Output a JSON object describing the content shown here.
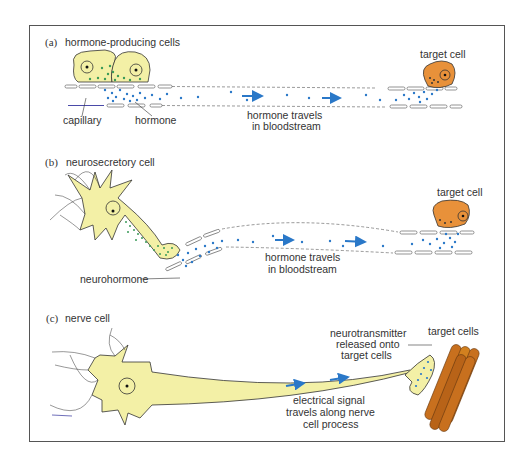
{
  "figure": {
    "panels": [
      {
        "id": "a",
        "letter": "(a)",
        "title": "hormone-producing cells",
        "labels": {
          "capillary": "capillary",
          "hormone": "hormone",
          "travel_line1": "hormone travels",
          "travel_line2": "in bloodstream",
          "target": "target cell"
        }
      },
      {
        "id": "b",
        "letter": "(b)",
        "title": "neurosecretory cell",
        "labels": {
          "neurohormone": "neurohormone",
          "travel_line1": "hormone travels",
          "travel_line2": "in bloodstream",
          "target": "target cell"
        }
      },
      {
        "id": "c",
        "letter": "(c)",
        "title": "nerve cell",
        "labels": {
          "nt_line1": "neurotransmitter",
          "nt_line2": "released onto",
          "nt_line3": "target cells",
          "target": "target cells",
          "signal_line1": "electrical signal",
          "signal_line2": "travels along nerve",
          "signal_line3": "cell process"
        }
      }
    ],
    "colors": {
      "producing_cell": "#f3f0a6",
      "target_cell": "#e8913a",
      "hormone_dot": "#2a78c8",
      "secretory_dot": "#3a9a58",
      "arrow": "#2a78c8",
      "muscle": "#c8701e",
      "outline": "#333333"
    }
  }
}
